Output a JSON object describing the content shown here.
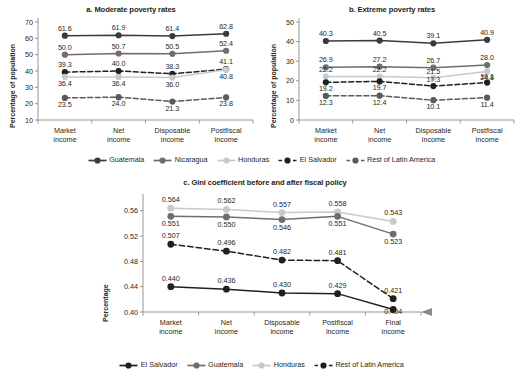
{
  "figure": {
    "background": "#ffffff"
  },
  "colors": {
    "guatemala": "#3b3b3b",
    "nicaragua": "#6e6e6e",
    "honduras": "#c9c9c9",
    "el_salvador": "#231f20",
    "rest_of_latin_america": "#5a5a5a",
    "axis": "#8a8a8a",
    "text": "#231f20"
  },
  "legend_top": {
    "items": [
      {
        "label": "Guatemala",
        "color": "#3b3b3b",
        "style": "solid"
      },
      {
        "label": "Nicaragua",
        "color": "#6e6e6e",
        "style": "solid"
      },
      {
        "label": "Honduras",
        "color": "#c9c9c9",
        "style": "solid"
      },
      {
        "label": "El Salvador",
        "color": "#231f20",
        "style": "dashed"
      },
      {
        "label": "Rest of Latin America",
        "color": "#5a5a5a",
        "style": "dashed"
      }
    ]
  },
  "legend_bottom": {
    "items": [
      {
        "label": "El Salvador",
        "color": "#231f20",
        "style": "solid"
      },
      {
        "label": "Guatemala",
        "color": "#6e6e6e",
        "style": "solid"
      },
      {
        "label": "Honduras",
        "color": "#c9c9c9",
        "style": "solid"
      },
      {
        "label": "Rest of Latin America",
        "color": "#231f20",
        "style": "dashed"
      }
    ]
  },
  "chart_data": [
    {
      "type": "line",
      "id": "moderate-poverty-rates",
      "title": "a. Moderate poverty rates",
      "xlabel": "",
      "ylabel": "Percentage of population",
      "categories": [
        "Market income",
        "Net income",
        "Disposable income",
        "Postfiscal income"
      ],
      "ylim": [
        10,
        70
      ],
      "yticks": [
        10,
        20,
        30,
        40,
        50,
        60,
        70
      ],
      "ytick_labels": [
        "10",
        "20",
        "30",
        "40",
        "50",
        "60",
        "70"
      ],
      "grid": false,
      "legend_position": "bottom",
      "series": [
        {
          "name": "Guatemala",
          "color": "#3b3b3b",
          "style": "solid",
          "values": [
            61.6,
            61.9,
            61.4,
            62.8
          ],
          "labels": [
            "61.6",
            "61.9",
            "61.4",
            "62.8"
          ]
        },
        {
          "name": "Nicaragua",
          "color": "#6e6e6e",
          "style": "solid",
          "values": [
            50.0,
            50.7,
            50.5,
            52.4
          ],
          "labels": [
            "50.0",
            "50.7",
            "50.5",
            "52.4"
          ]
        },
        {
          "name": "El Salvador",
          "color": "#231f20",
          "style": "dashed",
          "values": [
            39.3,
            40.0,
            38.3,
            41.1
          ],
          "labels": [
            "39.3",
            "40.0",
            "38.3",
            "41.1"
          ]
        },
        {
          "name": "Honduras",
          "color": "#c9c9c9",
          "style": "solid",
          "values": [
            36.4,
            36.4,
            36.0,
            40.8
          ],
          "labels": [
            "36.4",
            "36.4",
            "36.0",
            "40.8"
          ]
        },
        {
          "name": "Rest of Latin America",
          "color": "#5a5a5a",
          "style": "dashed",
          "values": [
            23.5,
            24.0,
            21.3,
            23.8
          ],
          "labels": [
            "23.5",
            "24.0",
            "21.3",
            "23.8"
          ]
        }
      ]
    },
    {
      "type": "line",
      "id": "extreme-poverty-rates",
      "title": "b. Extreme poverty rates",
      "xlabel": "",
      "ylabel": "Percentage of population",
      "categories": [
        "Market income",
        "Net income",
        "Disposable income",
        "Postfiscal income"
      ],
      "ylim": [
        0,
        50
      ],
      "yticks": [
        0,
        10,
        20,
        30,
        40,
        50
      ],
      "ytick_labels": [
        "0",
        "10",
        "20",
        "30",
        "40",
        "50"
      ],
      "grid": false,
      "legend_position": "bottom",
      "series": [
        {
          "name": "Guatemala",
          "color": "#3b3b3b",
          "style": "solid",
          "values": [
            40.3,
            40.5,
            39.1,
            40.9
          ],
          "labels": [
            "40.3",
            "40.5",
            "39.1",
            "40.9"
          ]
        },
        {
          "name": "Nicaragua",
          "color": "#6e6e6e",
          "style": "solid",
          "values": [
            26.9,
            27.2,
            26.7,
            28.0
          ],
          "labels": [
            "26.9",
            "27.2",
            "26.7",
            "28.0"
          ]
        },
        {
          "name": "Honduras",
          "color": "#c9c9c9",
          "style": "solid",
          "values": [
            22.2,
            22.2,
            21.5,
            24.8
          ],
          "labels": [
            "22.2",
            "22.2",
            "21.5",
            "24.8"
          ]
        },
        {
          "name": "El Salvador",
          "color": "#231f20",
          "style": "dashed",
          "values": [
            19.2,
            19.7,
            17.3,
            19.1
          ],
          "labels": [
            "19.2",
            "19.7",
            "17.3",
            "19.1"
          ]
        },
        {
          "name": "Rest of Latin America",
          "color": "#5a5a5a",
          "style": "dashed",
          "values": [
            12.3,
            12.4,
            10.1,
            11.4
          ],
          "labels": [
            "12.3",
            "12.4",
            "10.1",
            "11.4"
          ]
        }
      ]
    },
    {
      "type": "line",
      "id": "gini-coefficient",
      "title": "c. Gini coefficient before and after fiscal policy",
      "xlabel": "",
      "ylabel": "Percentage",
      "categories": [
        "Market income",
        "Net income",
        "Disposable income",
        "Postfiscal income",
        "Final income"
      ],
      "ylim": [
        0.4,
        0.58
      ],
      "yticks": [
        0.4,
        0.44,
        0.48,
        0.52,
        0.56
      ],
      "ytick_labels": [
        "0.40",
        "0.44",
        "0.48",
        "0.52",
        "0.56"
      ],
      "grid": false,
      "legend_position": "bottom",
      "series": [
        {
          "name": "Honduras",
          "color": "#c9c9c9",
          "style": "solid",
          "values": [
            0.564,
            0.562,
            0.557,
            0.558,
            0.543
          ],
          "labels": [
            "0.564",
            "0.562",
            "0.557",
            "0.558",
            "0.543"
          ]
        },
        {
          "name": "Guatemala",
          "color": "#6e6e6e",
          "style": "solid",
          "values": [
            0.551,
            0.55,
            0.546,
            0.551,
            0.523
          ],
          "labels": [
            "0.551",
            "0.550",
            "0.546",
            "0.551",
            "0.523"
          ]
        },
        {
          "name": "Rest of Latin America",
          "color": "#231f20",
          "style": "dashed",
          "values": [
            0.507,
            0.496,
            0.482,
            0.481,
            0.421
          ],
          "labels": [
            "0.507",
            "0.496",
            "0.482",
            "0.481",
            "0.421"
          ]
        },
        {
          "name": "El Salvador",
          "color": "#231f20",
          "style": "solid",
          "values": [
            0.44,
            0.436,
            0.43,
            0.429,
            0.404
          ],
          "labels": [
            "0.440",
            "0.436",
            "0.430",
            "0.429",
            "0.404"
          ]
        }
      ]
    }
  ]
}
